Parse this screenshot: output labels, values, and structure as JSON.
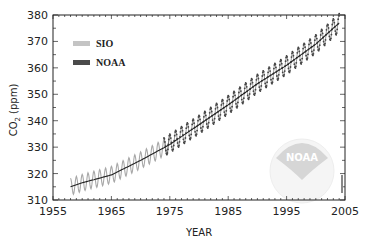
{
  "chart_data": {
    "type": "line",
    "title": "",
    "xlabel": "YEAR",
    "ylabel": "CO2 (ppm)",
    "ylabel_main": "CO",
    "ylabel_sub": "2",
    "ylabel_unit": "(ppm)",
    "xlim": [
      1955,
      2005
    ],
    "ylim": [
      310,
      380
    ],
    "x_ticks": [
      1955,
      1965,
      1975,
      1985,
      1995,
      2005
    ],
    "y_ticks": [
      310,
      320,
      330,
      340,
      350,
      360,
      370,
      380
    ],
    "grid": false,
    "legend_position": "upper-left",
    "legend": [
      {
        "name": "SIO",
        "color": "#bdbdbd"
      },
      {
        "name": "NOAA",
        "color": "#4a4a4a"
      }
    ],
    "series": [
      {
        "name": "SIO",
        "color": "#a8a8a8",
        "style": "seasonal-oscillating-line",
        "x_range": [
          1958,
          1975
        ],
        "trend": {
          "x": [
            1958,
            1960,
            1965,
            1970,
            1975
          ],
          "y": [
            315,
            316.5,
            319.5,
            325,
            331
          ]
        },
        "seasonal_amplitude": 3.2
      },
      {
        "name": "NOAA",
        "color": "#3a3a3a",
        "style": "seasonal-dotted-line",
        "x_range": [
          1974,
          2004
        ],
        "trend": {
          "x": [
            1974,
            1980,
            1985,
            1990,
            1995,
            2000,
            2004
          ],
          "y": [
            330,
            338.5,
            346,
            354,
            361,
            369,
            377
          ]
        },
        "seasonal_amplitude": 3.5
      },
      {
        "name": "Trend",
        "color": "#222222",
        "style": "smooth-line",
        "x": [
          1958,
          1960,
          1965,
          1970,
          1975,
          1980,
          1985,
          1990,
          1995,
          2000,
          2004
        ],
        "y": [
          315,
          316.5,
          319.5,
          325,
          331,
          338.5,
          346,
          354,
          361,
          369,
          377
        ]
      }
    ],
    "annotations": [
      {
        "type": "logo",
        "text": "NOAA"
      },
      {
        "type": "credit",
        "text": "tiny vertical credit text at right edge"
      }
    ]
  },
  "logo": {
    "text": "NOAA"
  }
}
